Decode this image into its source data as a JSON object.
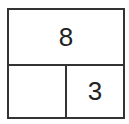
{
  "diagram": {
    "type": "number-bond-bar",
    "whole": "8",
    "parts": [
      "",
      "3"
    ],
    "border_color": "#333333"
  }
}
